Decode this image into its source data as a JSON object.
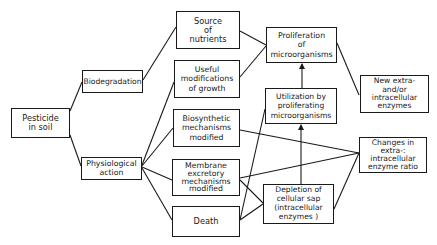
{
  "diagram": {
    "colors": {
      "line": "#1a1a1a",
      "box_border": "#1a1a1a",
      "background": "#ffffff",
      "text": "#1a1a1a"
    },
    "nodes": {
      "pesticide": {
        "label": "Pesticide\nin soil"
      },
      "biodegradation": {
        "label": "Biodegradation"
      },
      "physiological": {
        "label": "Physiological\naction"
      },
      "source_nutrients": {
        "label": "Source\nof\nnutrients"
      },
      "useful_modifications": {
        "label": "Useful\nmodifications\nof growth"
      },
      "biosynthetic": {
        "label": "Biosynthetic\nmechanisms\nmodified"
      },
      "membrane": {
        "label": "Membrane\nexcretory\nmechanisms\nmodified"
      },
      "death": {
        "label": "Death"
      },
      "proliferation": {
        "label": "Proliferation\nof\nmicroorganisms"
      },
      "utilization": {
        "label": "Utilization by\nproliferating\nmicroorganisms"
      },
      "new_enzymes": {
        "label": "New extra-\nand/or\nintracellular\nenzymes"
      },
      "changes_ratio": {
        "label": "Changes in\nextra-:\nintracellular\nenzyme ratio"
      },
      "depletion": {
        "label": "Depletion of\ncellular sap\n(intracellular\nenzymes )"
      }
    },
    "edges": [
      {
        "from": "pesticide",
        "to": "biodegradation"
      },
      {
        "from": "pesticide",
        "to": "physiological"
      },
      {
        "from": "biodegradation",
        "to": "source_nutrients"
      },
      {
        "from": "physiological",
        "to": "useful_modifications"
      },
      {
        "from": "physiological",
        "to": "biosynthetic"
      },
      {
        "from": "physiological",
        "to": "membrane"
      },
      {
        "from": "physiological",
        "to": "death"
      },
      {
        "from": "source_nutrients",
        "to": "proliferation"
      },
      {
        "from": "useful_modifications",
        "to": "proliferation"
      },
      {
        "from": "proliferation",
        "to": "new_enzymes"
      },
      {
        "from": "utilization",
        "to": "proliferation",
        "arrow": true
      },
      {
        "from": "depletion",
        "to": "utilization",
        "arrow": true
      },
      {
        "from": "death",
        "to": "utilization"
      },
      {
        "from": "biosynthetic",
        "to": "changes_ratio"
      },
      {
        "from": "membrane",
        "to": "changes_ratio"
      },
      {
        "from": "membrane",
        "to": "depletion"
      },
      {
        "from": "death",
        "to": "depletion"
      },
      {
        "from": "depletion",
        "to": "changes_ratio"
      }
    ]
  }
}
